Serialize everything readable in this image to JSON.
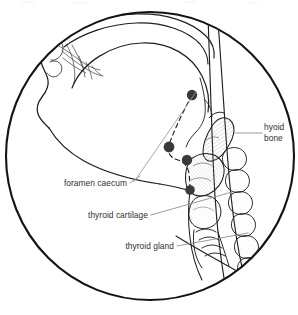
{
  "figure": {
    "kind": "anatomical-illustration",
    "view": "midsagittal head and neck section",
    "frame_shape": "circle",
    "background_color": "#ffffff",
    "outline_color": "#1a1a1a",
    "label_color": "#2f2f31",
    "marker_color": "#3a3a3c",
    "leader_color": "#8a8a8c"
  },
  "labels": {
    "hyoid_bone_line1": "hyoid",
    "hyoid_bone_line2": "bone",
    "foramen_caecum": "foramen caecum",
    "thyroid_cartilage": "thyroid cartilage",
    "thyroid_gland": "thyroid gland"
  },
  "markers": {
    "description": "descent path of the thyroglossal duct",
    "points": [
      {
        "name": "foramen-caecum-origin",
        "x": 192,
        "y": 95
      },
      {
        "name": "duct-midpoint-upper",
        "x": 169,
        "y": 147
      },
      {
        "name": "duct-midpoint-lower",
        "x": 187,
        "y": 160
      },
      {
        "name": "thyroid-gland-terminus",
        "x": 190,
        "y": 190
      }
    ]
  },
  "structures": [
    "nasal cavity",
    "hard palate",
    "tongue",
    "mandible",
    "hyoid bone",
    "thyroid cartilage",
    "thyroid gland",
    "cervical vertebrae",
    "trachea"
  ]
}
